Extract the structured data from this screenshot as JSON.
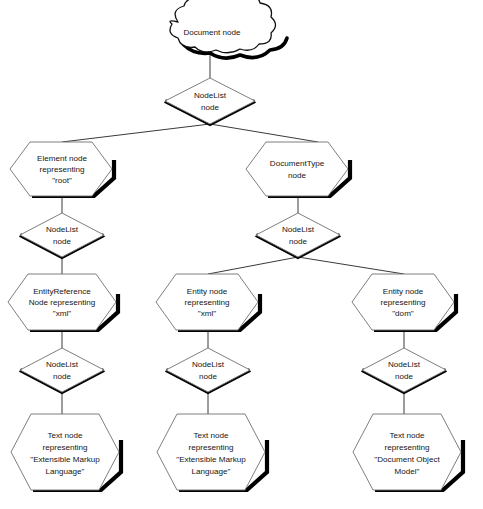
{
  "diagram": {
    "background_color": "#ffffff",
    "text_color": "#151515",
    "shape_outline_color": "#6f6f6f",
    "shadow_color": "#000000",
    "connector_color": "#3a3a3a",
    "nodes": {
      "document": {
        "shape": "cloud",
        "lines": [
          "Document node"
        ]
      },
      "nodelist_root": {
        "shape": "diamond",
        "lines": [
          "NodeList",
          "node"
        ]
      },
      "element_root": {
        "shape": "hexagon",
        "lines": [
          "Element node",
          "representing",
          "\"root\""
        ]
      },
      "documenttype": {
        "shape": "hexagon",
        "lines": [
          "DocumentType",
          "node"
        ]
      },
      "nodelist_element": {
        "shape": "diamond",
        "lines": [
          "NodeList",
          "node"
        ]
      },
      "nodelist_doctype": {
        "shape": "diamond",
        "lines": [
          "NodeList",
          "node"
        ]
      },
      "entityreference_xml": {
        "shape": "hexagon",
        "lines": [
          "EntityReference",
          "Node representing",
          "\"xml\""
        ]
      },
      "entity_xml": {
        "shape": "hexagon",
        "lines": [
          "Entity node",
          "representing",
          "\"xml\""
        ]
      },
      "entity_dom": {
        "shape": "hexagon",
        "lines": [
          "Entity node",
          "representing",
          "\"dom\""
        ]
      },
      "nodelist_entityref": {
        "shape": "diamond",
        "lines": [
          "NodeList",
          "node"
        ]
      },
      "nodelist_entity_xml": {
        "shape": "diamond",
        "lines": [
          "NodeList",
          "node"
        ]
      },
      "nodelist_entity_dom": {
        "shape": "diamond",
        "lines": [
          "NodeList",
          "node"
        ]
      },
      "text_xml_left": {
        "shape": "hexagon",
        "lines": [
          "Text node",
          "representing",
          "\"Extensible Markup",
          "Language\""
        ]
      },
      "text_xml_middle": {
        "shape": "hexagon",
        "lines": [
          "Text node",
          "representing",
          "\"Extensible Markup",
          "Language\""
        ]
      },
      "text_dom_right": {
        "shape": "hexagon",
        "lines": [
          "Text node",
          "representing",
          "\"Document Object",
          "Model\""
        ]
      }
    }
  }
}
